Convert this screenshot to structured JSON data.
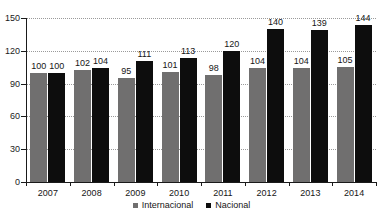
{
  "chart_data": {
    "type": "bar",
    "title": "",
    "xlabel": "",
    "ylabel": "",
    "categories": [
      "2007",
      "2008",
      "2009",
      "2010",
      "2011",
      "2012",
      "2013",
      "2014"
    ],
    "series": [
      {
        "name": "Internacional",
        "color": "#706F6F",
        "values": [
          100,
          102,
          95,
          101,
          98,
          104,
          104,
          105
        ]
      },
      {
        "name": "Nacional",
        "color": "#0D0D0D",
        "values": [
          100,
          104,
          111,
          113,
          120,
          140,
          139,
          144
        ]
      }
    ],
    "ylim": [
      0,
      150
    ],
    "yticks": [
      0,
      30,
      60,
      90,
      120,
      150
    ],
    "ytick_labels": [
      "0",
      "30",
      "60",
      "90",
      "120",
      "150"
    ],
    "grid": true,
    "data_labels": true,
    "legend_position": "bottom"
  },
  "legend": {
    "entries": [
      {
        "label": "Internacional"
      },
      {
        "label": "Nacional"
      }
    ]
  }
}
